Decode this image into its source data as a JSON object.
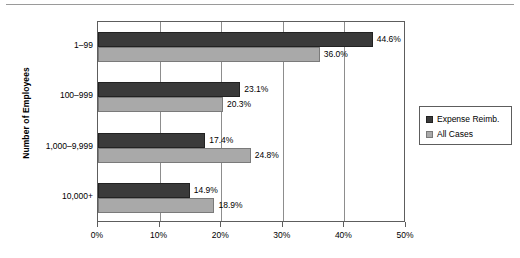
{
  "chart_data": {
    "type": "bar",
    "orientation": "horizontal",
    "title": "",
    "xlabel": "",
    "ylabel": "Number of Employees",
    "categories": [
      "1–99",
      "100–999",
      "1,000–9,999",
      "10,000+"
    ],
    "series": [
      {
        "name": "Expense Reimb.",
        "color": "#3a3a3a",
        "values": [
          44.6,
          23.1,
          17.4,
          14.9
        ],
        "labels": [
          "44.6%",
          "23.1%",
          "17.4%",
          "14.9%"
        ]
      },
      {
        "name": "All Cases",
        "color": "#a9a9a9",
        "values": [
          36.0,
          20.3,
          24.8,
          18.9
        ],
        "labels": [
          "36.0%",
          "20.3%",
          "24.8%",
          "18.9%"
        ]
      }
    ],
    "xlim": [
      0,
      50
    ],
    "xticks": [
      0,
      10,
      20,
      30,
      40,
      50
    ],
    "xtick_labels": [
      "0%",
      "10%",
      "20%",
      "30%",
      "40%",
      "50%"
    ],
    "grid": "vertical",
    "legend_position": "right"
  },
  "legend": {
    "entries": [
      {
        "label": "Expense Reimb."
      },
      {
        "label": "All Cases"
      }
    ]
  }
}
